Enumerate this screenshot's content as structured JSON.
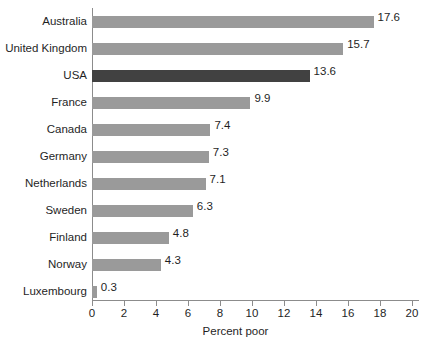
{
  "chart_data": {
    "type": "bar",
    "orientation": "horizontal",
    "title": "",
    "xlabel": "Percent poor",
    "ylabel": "",
    "xlim": [
      0,
      20
    ],
    "xticks": [
      0,
      2,
      4,
      6,
      8,
      10,
      12,
      14,
      16,
      18,
      20
    ],
    "grid": false,
    "legend": null,
    "categories": [
      "Australia",
      "United Kingdom",
      "USA",
      "France",
      "Canada",
      "Germany",
      "Netherlands",
      "Sweden",
      "Finland",
      "Norway",
      "Luxembourg"
    ],
    "values": [
      17.6,
      15.7,
      13.6,
      9.9,
      7.4,
      7.3,
      7.1,
      6.3,
      4.8,
      4.3,
      0.3
    ],
    "value_labels": [
      "17.6",
      "15.7",
      "13.6",
      "9.9",
      "7.4",
      "7.3",
      "7.1",
      "6.3",
      "4.8",
      "4.3",
      "0.3"
    ],
    "highlight_category": "USA",
    "colors": {
      "bar": "#9a9a9a",
      "bar_highlight": "#414141",
      "axis": "#8c8c8c",
      "text": "#1f1f1f",
      "background": "#ffffff"
    }
  },
  "axis": {
    "tick_labels": [
      "0",
      "2",
      "4",
      "6",
      "8",
      "10",
      "12",
      "14",
      "16",
      "18",
      "20"
    ],
    "x_title": "Percent poor"
  }
}
